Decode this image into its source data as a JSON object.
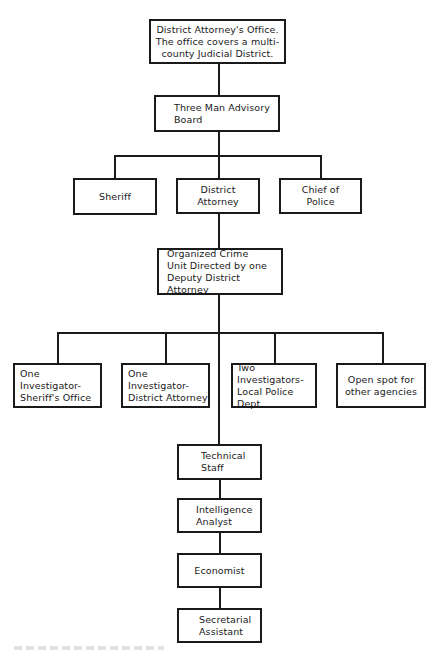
{
  "diagram": {
    "type": "organizational-chart",
    "nodes": {
      "da_office": "District Attorney's Office.\nThe office covers a multi-\ncounty Judicial District.",
      "advisory_board": "Three Man Advisory\nBoard",
      "sheriff": "Sheriff",
      "district_attorney": "District\nAttorney",
      "chief_of_police": "Chief of\nPolice",
      "organized_crime_unit": "Organized Crime\nUnit Directed by one\nDeputy District Attorney",
      "investigator_sheriff": "One Investigator-\nSheriff's Office",
      "investigator_da": "One Investigator-\nDistrict Attorney",
      "investigators_police": "Two Investigators-\nLocal Police Dept.",
      "open_spot": "Open spot for\nother agencies",
      "technical_staff": "Technical\nStaff",
      "intelligence_analyst": "Intelligence\nAnalyst",
      "economist": "Economist",
      "secretarial_assistant": "Secretarial\nAssistant"
    },
    "edges": [
      [
        "da_office",
        "advisory_board"
      ],
      [
        "advisory_board",
        "sheriff"
      ],
      [
        "advisory_board",
        "district_attorney"
      ],
      [
        "advisory_board",
        "chief_of_police"
      ],
      [
        "district_attorney",
        "organized_crime_unit"
      ],
      [
        "organized_crime_unit",
        "investigator_sheriff"
      ],
      [
        "organized_crime_unit",
        "investigator_da"
      ],
      [
        "organized_crime_unit",
        "investigators_police"
      ],
      [
        "organized_crime_unit",
        "open_spot"
      ],
      [
        "organized_crime_unit",
        "technical_staff"
      ],
      [
        "technical_staff",
        "intelligence_analyst"
      ],
      [
        "intelligence_analyst",
        "economist"
      ],
      [
        "economist",
        "secretarial_assistant"
      ]
    ]
  },
  "colors": {
    "line": "#1a1a1a",
    "background": "#ffffff"
  }
}
